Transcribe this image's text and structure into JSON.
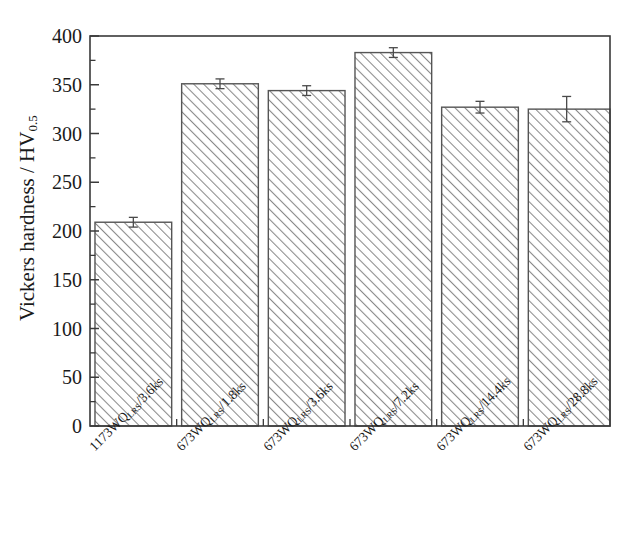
{
  "chart_data": {
    "type": "bar",
    "title": "",
    "xlabel": "",
    "ylabel": "Vickers hardness / HV",
    "ylabel_sub": "0.5",
    "categories": [
      "1173WQ_LRS/3.6ks",
      "673WQ_LRS/1.8ks",
      "673WQ_LRS/3.6ks",
      "673WQ_LRS/7.2ks",
      "673WQ_LRS/14.4ks",
      "673WQ_LRS/28.8ks"
    ],
    "category_parts": [
      {
        "pre": "1173WQ",
        "sub": "LRS",
        "post": "/3.6ks"
      },
      {
        "pre": "673WQ",
        "sub": "LRS",
        "post": "/1.8ks"
      },
      {
        "pre": "673WQ",
        "sub": "LRS",
        "post": "/3.6ks"
      },
      {
        "pre": "673WQ",
        "sub": "LRS",
        "post": "/7.2ks"
      },
      {
        "pre": "673WQ",
        "sub": "LRS",
        "post": "/14.4ks"
      },
      {
        "pre": "673WQ",
        "sub": "LRS",
        "post": "/28.8ks"
      }
    ],
    "values": [
      209,
      351,
      344,
      383,
      327,
      325
    ],
    "errors": [
      5,
      5,
      5,
      5,
      6,
      13
    ],
    "ylim": [
      0,
      400
    ],
    "yticks": [
      0,
      50,
      100,
      150,
      200,
      250,
      300,
      350,
      400
    ],
    "ytick_labels": [
      "0",
      "50",
      "100",
      "150",
      "200",
      "250",
      "300",
      "350",
      "400"
    ],
    "minor_tick_step": 25,
    "grid": false,
    "legend": "none",
    "bar_fill": "hatch-45",
    "colors": {
      "axis": "#3a3a3a",
      "bar_edge": "#555555",
      "hatch": "#808080",
      "error_bar": "#4a4a4a",
      "background": "#ffffff"
    }
  },
  "figure": {
    "plot_left": 90,
    "plot_right": 610,
    "plot_top": 36,
    "plot_bottom": 426
  }
}
